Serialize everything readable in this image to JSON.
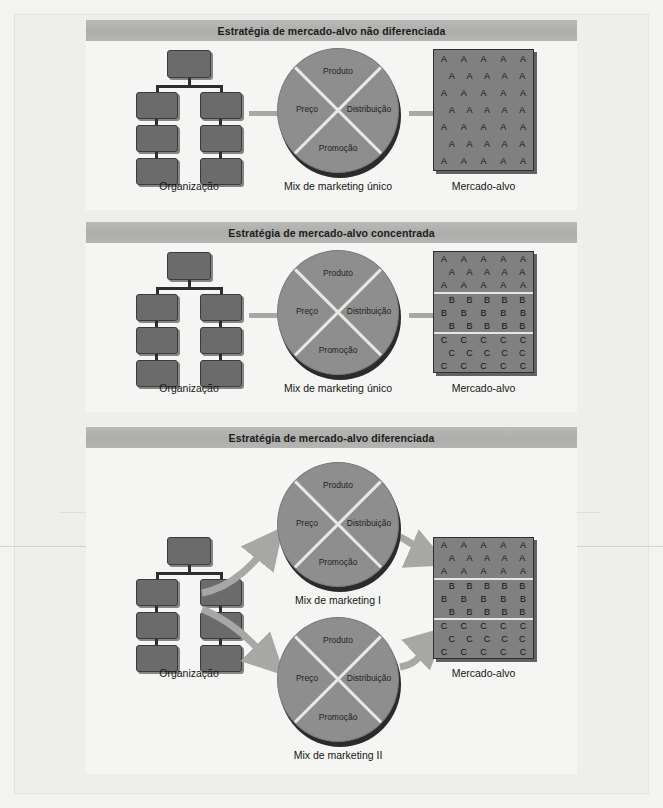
{
  "figure": {
    "labels": {
      "organizacao": "Organização",
      "mercado_alvo": "Mercado-alvo"
    },
    "pie_labels": {
      "produto": "Produto",
      "preco": "Preço",
      "distribuicao": "Distribuição",
      "promocao": "Promoção"
    },
    "colors": {
      "band": "#b0b0ae",
      "panel_bg": "#f5f5f3",
      "page_bg": "#eeeeec",
      "box_fill": "#6b6b6b",
      "pie_fill": "#8e8e8e",
      "market_fill": "#808080",
      "arrow": "#a7a7a5",
      "text": "#151515"
    },
    "panels": [
      {
        "id": "undifferentiated",
        "title": "Estratégia de mercado-alvo não diferenciada",
        "org_label": "Organização",
        "mix_label": "Mix de marketing único",
        "market_label": "Mercado-alvo",
        "mixes": [
          "Mix de marketing único"
        ],
        "market_segments": [
          {
            "letter": "A",
            "rows": [
              {
                "count": 5,
                "indent": false
              },
              {
                "count": 5,
                "indent": true
              },
              {
                "count": 5,
                "indent": false
              },
              {
                "count": 5,
                "indent": true
              },
              {
                "count": 5,
                "indent": false
              },
              {
                "count": 5,
                "indent": true
              },
              {
                "count": 5,
                "indent": false
              }
            ]
          }
        ]
      },
      {
        "id": "concentrated",
        "title": "Estratégia de mercado-alvo concentrada",
        "org_label": "Organização",
        "mix_label": "Mix de marketing único",
        "market_label": "Mercado-alvo",
        "mixes": [
          "Mix de marketing único"
        ],
        "market_segments": [
          {
            "letter": "A",
            "rows": [
              {
                "count": 5,
                "indent": false
              },
              {
                "count": 5,
                "indent": true
              },
              {
                "count": 5,
                "indent": false
              }
            ]
          },
          {
            "letter": "B",
            "rows": [
              {
                "count": 5,
                "indent": true
              },
              {
                "count": 5,
                "indent": false
              },
              {
                "count": 5,
                "indent": true
              }
            ]
          },
          {
            "letter": "C",
            "rows": [
              {
                "count": 5,
                "indent": false
              },
              {
                "count": 5,
                "indent": true
              },
              {
                "count": 5,
                "indent": false
              }
            ]
          }
        ]
      },
      {
        "id": "differentiated",
        "title": "Estratégia de mercado-alvo diferenciada",
        "org_label": "Organização",
        "market_label": "Mercado-alvo",
        "mixes": [
          "Mix de marketing I",
          "Mix de marketing II"
        ],
        "market_segments": [
          {
            "letter": "A",
            "rows": [
              {
                "count": 5,
                "indent": false
              },
              {
                "count": 5,
                "indent": true
              },
              {
                "count": 5,
                "indent": false
              }
            ]
          },
          {
            "letter": "B",
            "rows": [
              {
                "count": 5,
                "indent": true
              },
              {
                "count": 5,
                "indent": false
              },
              {
                "count": 5,
                "indent": true
              }
            ]
          },
          {
            "letter": "C",
            "rows": [
              {
                "count": 5,
                "indent": false
              },
              {
                "count": 5,
                "indent": true
              },
              {
                "count": 5,
                "indent": false
              }
            ]
          }
        ]
      }
    ]
  }
}
